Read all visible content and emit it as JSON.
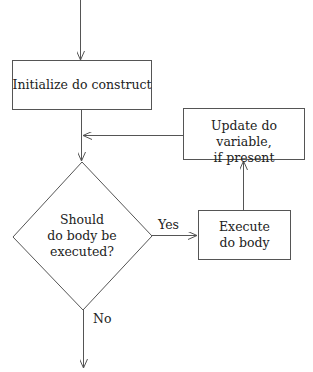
{
  "diagram": {
    "nodes": {
      "init": {
        "label": "Initialize do construct"
      },
      "decision": {
        "line1": "Should",
        "line2": "do body be",
        "line3": "executed?"
      },
      "execute": {
        "line1": "Execute",
        "line2": "do body"
      },
      "update": {
        "line1": "Update do variable,",
        "line2": "if present"
      }
    },
    "edges": {
      "yes_label": "Yes",
      "no_label": "No"
    },
    "colors": {
      "stroke": "#555555",
      "text": "#222222",
      "background": "#ffffff"
    }
  }
}
